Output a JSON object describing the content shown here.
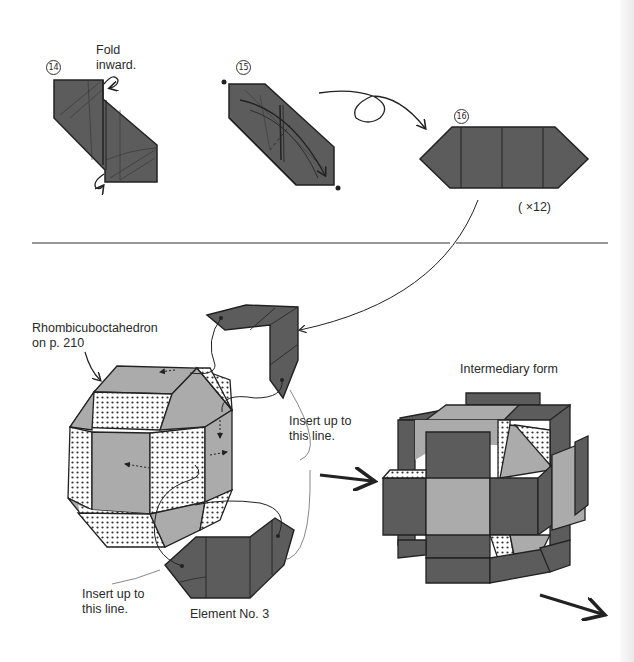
{
  "colors": {
    "dark_paper": "#5c5c5c",
    "light_paper": "#ababab",
    "outline": "#222222",
    "background": "#ffffff"
  },
  "steps": [
    {
      "number": "14",
      "symbol": "⑭",
      "instruction": "Fold\ninward.",
      "instruction_line1": "Fold",
      "instruction_line2": "inward."
    },
    {
      "number": "15",
      "symbol": "⑮",
      "instruction": "",
      "note": "turn-over-icon"
    },
    {
      "number": "16",
      "symbol": "⑯",
      "multiplier": "( ×12)"
    }
  ],
  "assembly": {
    "model_label_line1": "Rhombicuboctahedron",
    "model_label_line2": "on p. 210",
    "insert_label_upper_line1": "Insert up to",
    "insert_label_upper_line2": "this line.",
    "insert_label_lower_line1": "Insert up to",
    "insert_label_lower_line2": "this line.",
    "element_label": "Element No. 3",
    "intermediary_label": "Intermediary form"
  }
}
